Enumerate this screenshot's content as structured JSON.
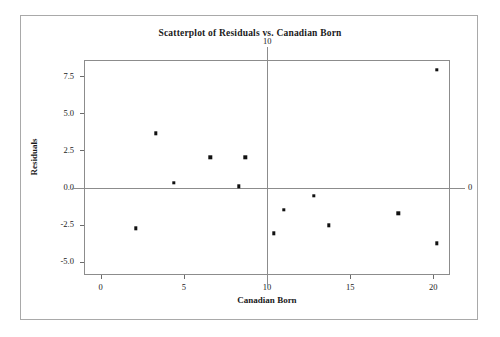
{
  "chart_data": {
    "type": "scatter",
    "title": "Scatterplot of Residuals vs. Canadian Born",
    "xlabel": "Canadian Born",
    "ylabel": "Residuals",
    "xlim": [
      -1.0,
      21.0
    ],
    "ylim": [
      -5.9,
      8.6
    ],
    "xticks": [
      0,
      5,
      10,
      15,
      20
    ],
    "xticklabels": [
      "0",
      "5",
      "10",
      "15",
      "20"
    ],
    "yticks": [
      7.5,
      5.0,
      2.5,
      0.0,
      -2.5,
      -5.0
    ],
    "yticklabels": [
      "7.5",
      "5.0",
      "2.5",
      "0.0",
      "-2.5",
      "-5.0"
    ],
    "grid": false,
    "legend": null,
    "reference_lines": [
      {
        "name": "vertical-reference-line",
        "orientation": "vertical",
        "value": 10,
        "label": "10"
      },
      {
        "name": "horizontal-reference-line",
        "orientation": "horizontal",
        "value": 0,
        "label": "0"
      }
    ],
    "series": [
      {
        "name": "residuals",
        "marker": "square",
        "color": "#111111",
        "points": [
          {
            "x": 2.1,
            "y": -2.75
          },
          {
            "x": 3.3,
            "y": 3.65
          },
          {
            "x": 4.4,
            "y": 0.33
          },
          {
            "x": 6.6,
            "y": 2.05
          },
          {
            "x": 8.3,
            "y": 0.07
          },
          {
            "x": 8.7,
            "y": 2.05
          },
          {
            "x": 10.4,
            "y": -3.1
          },
          {
            "x": 11.0,
            "y": -1.5
          },
          {
            "x": 12.8,
            "y": -0.55
          },
          {
            "x": 13.7,
            "y": -2.55
          },
          {
            "x": 17.9,
            "y": -1.75
          },
          {
            "x": 20.2,
            "y": 7.95
          },
          {
            "x": 20.2,
            "y": -3.75
          }
        ]
      }
    ]
  }
}
